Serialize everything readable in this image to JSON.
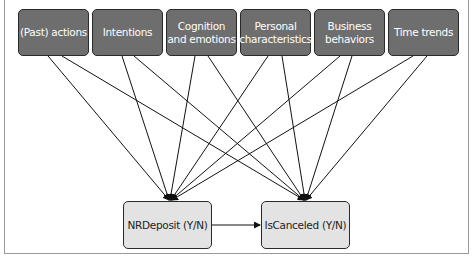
{
  "diagram": {
    "top_nodes": [
      {
        "id": "past_actions",
        "label": "(Past) actions"
      },
      {
        "id": "intentions",
        "label": "Intentions"
      },
      {
        "id": "cognition",
        "label": "Cognition and emotions"
      },
      {
        "id": "personal",
        "label": "Personal characteristics"
      },
      {
        "id": "business",
        "label": "Business behaviors"
      },
      {
        "id": "time",
        "label": "Time trends"
      }
    ],
    "bottom_nodes": [
      {
        "id": "nrdeposit",
        "label": "NRDeposit (Y/N)"
      },
      {
        "id": "iscanceled",
        "label": "IsCanceled (Y/N)"
      }
    ],
    "edges": [
      [
        "past_actions",
        "nrdeposit"
      ],
      [
        "past_actions",
        "iscanceled"
      ],
      [
        "intentions",
        "nrdeposit"
      ],
      [
        "intentions",
        "iscanceled"
      ],
      [
        "cognition",
        "nrdeposit"
      ],
      [
        "cognition",
        "iscanceled"
      ],
      [
        "personal",
        "nrdeposit"
      ],
      [
        "personal",
        "iscanceled"
      ],
      [
        "business",
        "nrdeposit"
      ],
      [
        "business",
        "iscanceled"
      ],
      [
        "time",
        "nrdeposit"
      ],
      [
        "time",
        "iscanceled"
      ],
      [
        "nrdeposit",
        "iscanceled"
      ]
    ],
    "colors": {
      "top_fill": "#6e6e6e",
      "bottom_fill": "#e3e3e3",
      "edge": "#111111"
    }
  }
}
